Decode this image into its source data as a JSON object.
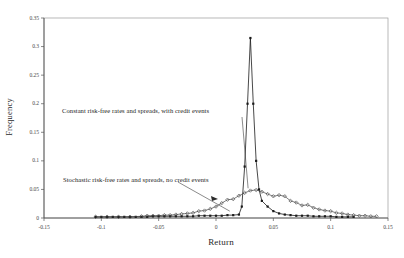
{
  "chart_data": {
    "type": "line",
    "title": "",
    "xlabel": "Return",
    "ylabel": "Frequency",
    "xlim": [
      -0.15,
      0.15
    ],
    "ylim": [
      0,
      0.35
    ],
    "grid": false,
    "legend_position": "none",
    "xticks": [
      "-0.15",
      "-0.1",
      "-0.05",
      "0",
      "0.05",
      "0.1",
      "0.15"
    ],
    "xtick_values": [
      -0.15,
      -0.1,
      -0.05,
      0,
      0.05,
      0.1,
      0.15
    ],
    "yticks": [
      "0",
      "0.05",
      "0.1",
      "0.15",
      "0.2",
      "0.25",
      "0.3",
      "0.35"
    ],
    "ytick_values": [
      0,
      0.05,
      0.1,
      0.15,
      0.2,
      0.25,
      0.3,
      0.35
    ],
    "annotations": [
      {
        "name": "constant-series-label",
        "text": "Constant risk-free rates and spreads, with credit events",
        "points_to_x": 0.028,
        "points_to_y": 0.052
      },
      {
        "name": "stochastic-series-label",
        "text": "Stochastic risk-free rates and spreads, no credit events",
        "points_to_x": 0.012,
        "points_to_y": 0.012
      }
    ],
    "series": [
      {
        "name": "Constant risk-free rates and spreads, with credit events",
        "marker": "square",
        "color": "#1a1a1a",
        "x": [
          -0.105,
          -0.1,
          -0.095,
          -0.09,
          -0.085,
          -0.08,
          -0.075,
          -0.07,
          -0.065,
          -0.06,
          -0.055,
          -0.05,
          -0.045,
          -0.04,
          -0.035,
          -0.03,
          -0.025,
          -0.02,
          -0.015,
          -0.01,
          -0.005,
          0.0,
          0.005,
          0.01,
          0.015,
          0.02,
          0.0225,
          0.025,
          0.0275,
          0.03,
          0.0325,
          0.035,
          0.0375,
          0.04,
          0.045,
          0.05,
          0.055,
          0.06,
          0.065,
          0.07,
          0.075,
          0.08,
          0.085,
          0.09,
          0.095,
          0.1,
          0.105,
          0.11,
          0.115,
          0.12
        ],
        "y": [
          0.002,
          0.002,
          0.002,
          0.002,
          0.002,
          0.002,
          0.002,
          0.002,
          0.002,
          0.002,
          0.003,
          0.003,
          0.003,
          0.003,
          0.003,
          0.003,
          0.003,
          0.003,
          0.004,
          0.004,
          0.004,
          0.004,
          0.004,
          0.005,
          0.005,
          0.006,
          0.02,
          0.09,
          0.2,
          0.315,
          0.2,
          0.1,
          0.05,
          0.03,
          0.02,
          0.012,
          0.008,
          0.006,
          0.005,
          0.004,
          0.004,
          0.004,
          0.003,
          0.003,
          0.003,
          0.003,
          0.002,
          0.002,
          0.002,
          0.002
        ]
      },
      {
        "name": "Stochastic risk-free rates and spreads, no credit events",
        "marker": "diamond",
        "color": "#3a3a3a",
        "x": [
          -0.105,
          -0.095,
          -0.085,
          -0.075,
          -0.065,
          -0.06,
          -0.055,
          -0.05,
          -0.045,
          -0.04,
          -0.035,
          -0.03,
          -0.025,
          -0.02,
          -0.015,
          -0.01,
          -0.005,
          0.0,
          0.005,
          0.01,
          0.015,
          0.02,
          0.025,
          0.03,
          0.035,
          0.04,
          0.045,
          0.05,
          0.055,
          0.06,
          0.065,
          0.07,
          0.075,
          0.08,
          0.085,
          0.09,
          0.095,
          0.1,
          0.105,
          0.11,
          0.115,
          0.12,
          0.125,
          0.13,
          0.135,
          0.14
        ],
        "y": [
          0.002,
          0.002,
          0.002,
          0.002,
          0.003,
          0.004,
          0.004,
          0.004,
          0.005,
          0.005,
          0.006,
          0.007,
          0.008,
          0.009,
          0.012,
          0.013,
          0.016,
          0.02,
          0.026,
          0.032,
          0.033,
          0.039,
          0.044,
          0.048,
          0.049,
          0.046,
          0.042,
          0.038,
          0.04,
          0.038,
          0.03,
          0.027,
          0.022,
          0.023,
          0.018,
          0.015,
          0.013,
          0.012,
          0.009,
          0.008,
          0.006,
          0.005,
          0.004,
          0.004,
          0.003,
          0.003
        ]
      }
    ]
  }
}
